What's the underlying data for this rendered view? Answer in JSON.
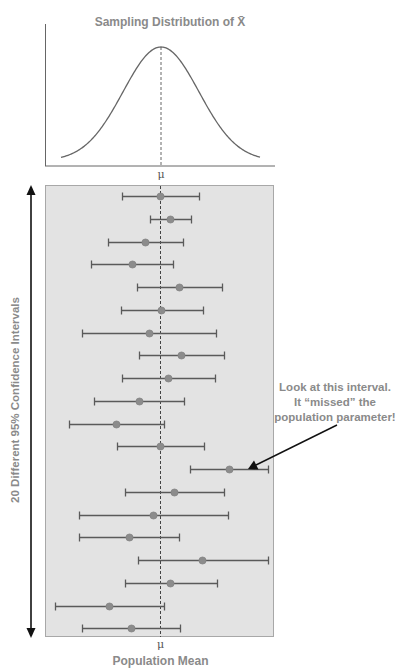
{
  "top_chart": {
    "title": "Sampling Distribution of X̄",
    "mean_label": "μ"
  },
  "bottom_chart": {
    "y_axis_label": "20 Different 95% Confidence Intervals",
    "x_axis_label": "Population Mean",
    "mean_label": "μ",
    "annotation": {
      "lines": [
        "Look at this interval.",
        "It “missed” the",
        "population parameter!"
      ],
      "points_to_interval": 13
    }
  },
  "colors": {
    "panel_fill": "#e3e3e3",
    "panel_border": "#a8a8a8",
    "interval_line": "#5a5a5a",
    "point": "#8c8c8c",
    "curve": "#666666",
    "label_text": "#8a8a8a"
  },
  "chart_data": [
    {
      "type": "line",
      "title": "Sampling Distribution of X̄",
      "description": "Normal (bell-shaped) curve centered at the population mean μ",
      "xlabel": "",
      "ylabel": "",
      "x_ticks": [
        "μ"
      ],
      "center": "μ",
      "grid": false
    },
    {
      "type": "scatter",
      "title": "20 Different 95% Confidence Intervals",
      "xlabel": "Population Mean",
      "ylabel": "20 Different 95% Confidence Intervals",
      "reference_line": "μ (dashed vertical)",
      "units": "offset from μ in screen pixels (negative = left of μ)",
      "intervals": [
        {
          "id": 1,
          "lower": -38,
          "estimate": 0,
          "upper": 39,
          "contains_mu": true
        },
        {
          "id": 2,
          "lower": -10,
          "estimate": 10,
          "upper": 31,
          "contains_mu": true
        },
        {
          "id": 3,
          "lower": -52,
          "estimate": -15,
          "upper": 23,
          "contains_mu": true
        },
        {
          "id": 4,
          "lower": -69,
          "estimate": -28,
          "upper": 13,
          "contains_mu": true
        },
        {
          "id": 5,
          "lower": -23,
          "estimate": 19,
          "upper": 62,
          "contains_mu": true
        },
        {
          "id": 6,
          "lower": -39,
          "estimate": 1,
          "upper": 43,
          "contains_mu": true
        },
        {
          "id": 7,
          "lower": -78,
          "estimate": -11,
          "upper": 56,
          "contains_mu": true
        },
        {
          "id": 8,
          "lower": -21,
          "estimate": 21,
          "upper": 64,
          "contains_mu": true
        },
        {
          "id": 9,
          "lower": -38,
          "estimate": 8,
          "upper": 55,
          "contains_mu": true
        },
        {
          "id": 10,
          "lower": -66,
          "estimate": -21,
          "upper": 24,
          "contains_mu": true
        },
        {
          "id": 11,
          "lower": -91,
          "estimate": -44,
          "upper": 4,
          "contains_mu": true
        },
        {
          "id": 12,
          "lower": -43,
          "estimate": 0,
          "upper": 44,
          "contains_mu": true
        },
        {
          "id": 13,
          "lower": 30,
          "estimate": 69,
          "upper": 108,
          "contains_mu": false
        },
        {
          "id": 14,
          "lower": -35,
          "estimate": 14,
          "upper": 64,
          "contains_mu": true
        },
        {
          "id": 15,
          "lower": -81,
          "estimate": -7,
          "upper": 68,
          "contains_mu": true
        },
        {
          "id": 16,
          "lower": -81,
          "estimate": -31,
          "upper": 19,
          "contains_mu": true
        },
        {
          "id": 17,
          "lower": -22,
          "estimate": 42,
          "upper": 108,
          "contains_mu": true
        },
        {
          "id": 18,
          "lower": -35,
          "estimate": 10,
          "upper": 57,
          "contains_mu": true
        },
        {
          "id": 19,
          "lower": -105,
          "estimate": -51,
          "upper": 4,
          "contains_mu": true
        },
        {
          "id": 20,
          "lower": -78,
          "estimate": -29,
          "upper": 20,
          "contains_mu": true
        }
      ]
    }
  ]
}
